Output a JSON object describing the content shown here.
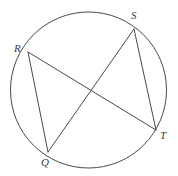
{
  "figure": {
    "kind": "circle-with-inscribed-chords",
    "background_color": "#ffffff",
    "stroke_color": "#4a4a4a",
    "label_color": "#3d3d3d",
    "stroke_width": 1,
    "circle": {
      "name": "circumscribed-circle",
      "cx": 88.5,
      "cy": 90,
      "r": 78
    },
    "points": [
      {
        "id": "R",
        "label": "R",
        "x": 28,
        "y": 52,
        "label_x": 14,
        "label_y": 43
      },
      {
        "id": "S",
        "label": "S",
        "x": 134,
        "y": 29,
        "label_x": 131,
        "label_y": 10
      },
      {
        "id": "T",
        "label": "T",
        "x": 156,
        "y": 130,
        "label_x": 160,
        "label_y": 130
      },
      {
        "id": "Q",
        "label": "Q",
        "x": 48,
        "y": 152,
        "label_x": 41,
        "label_y": 157
      }
    ],
    "chords": [
      {
        "id": "RQ",
        "from": "R",
        "to": "Q",
        "x1": 28,
        "y1": 52,
        "x2": 48,
        "y2": 152
      },
      {
        "id": "RT",
        "from": "R",
        "to": "T",
        "x1": 28,
        "y1": 52,
        "x2": 156,
        "y2": 130
      },
      {
        "id": "SQ",
        "from": "S",
        "to": "Q",
        "x1": 134,
        "y1": 29,
        "x2": 48,
        "y2": 152
      },
      {
        "id": "ST",
        "from": "S",
        "to": "T",
        "x1": 134,
        "y1": 29,
        "x2": 156,
        "y2": 130
      }
    ]
  }
}
